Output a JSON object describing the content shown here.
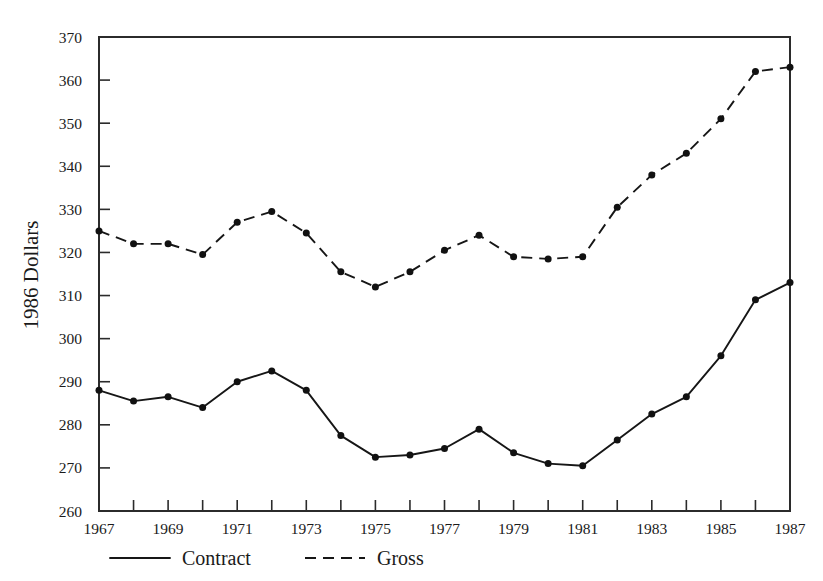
{
  "chart_data": {
    "type": "line",
    "title": "",
    "xlabel": "",
    "ylabel": "1986  Dollars",
    "xlim": [
      1967,
      1987
    ],
    "ylim": [
      260,
      370
    ],
    "grid": false,
    "legend_position": "bottom",
    "x": [
      1967,
      1968,
      1969,
      1970,
      1971,
      1972,
      1973,
      1974,
      1975,
      1976,
      1977,
      1978,
      1979,
      1980,
      1981,
      1982,
      1983,
      1984,
      1985,
      1986,
      1987
    ],
    "x_tick_labels": [
      "1967",
      "1969",
      "1971",
      "1973",
      "1975",
      "1977",
      "1979",
      "1981",
      "1983",
      "1985",
      "1987"
    ],
    "x_tick_values": [
      1967,
      1969,
      1971,
      1973,
      1975,
      1977,
      1979,
      1981,
      1983,
      1985,
      1987
    ],
    "y_tick_labels": [
      "260",
      "270",
      "280",
      "290",
      "300",
      "310",
      "320",
      "330",
      "340",
      "350",
      "360",
      "370"
    ],
    "y_tick_values": [
      260,
      270,
      280,
      290,
      300,
      310,
      320,
      330,
      340,
      350,
      360,
      370
    ],
    "series": [
      {
        "name": "Contract",
        "style": "solid",
        "marker": "circle",
        "values": [
          288.0,
          285.5,
          286.5,
          284.0,
          290.0,
          292.5,
          288.0,
          277.5,
          272.5,
          273.0,
          274.5,
          279.0,
          273.5,
          271.0,
          270.5,
          276.5,
          282.5,
          286.5,
          296.0,
          309.0,
          313.0
        ]
      },
      {
        "name": "Gross",
        "style": "dashed",
        "marker": "circle",
        "values": [
          325.0,
          322.0,
          322.0,
          319.5,
          327.0,
          329.5,
          324.5,
          315.5,
          312.0,
          315.5,
          320.5,
          324.0,
          319.0,
          318.5,
          319.0,
          330.5,
          338.0,
          343.0,
          351.0,
          362.0,
          363.0
        ]
      }
    ]
  },
  "legend": {
    "entries": [
      {
        "label": "Contract",
        "style": "solid"
      },
      {
        "label": "Gross",
        "style": "dashed"
      }
    ]
  }
}
